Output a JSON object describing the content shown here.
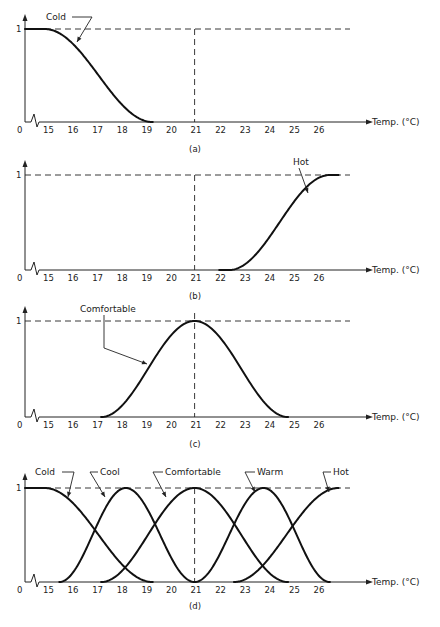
{
  "figure": {
    "x_axis_title": "Temp. (°C)",
    "y_tick_top": "1",
    "x_origin_label": "0",
    "x_tick_labels": [
      "15",
      "16",
      "17",
      "18",
      "19",
      "20",
      "21",
      "22",
      "23",
      "24",
      "25",
      "26"
    ]
  },
  "chart_data": [
    {
      "panel": "(a)",
      "type": "line",
      "title": "",
      "xlabel": "Temp. (°C)",
      "ylabel": "",
      "xlim": [
        15,
        27
      ],
      "ylim": [
        0,
        1
      ],
      "x_ticks": [
        15,
        16,
        17,
        18,
        19,
        20,
        21,
        22,
        23,
        24,
        25,
        26
      ],
      "y_ticks": [
        1
      ],
      "reference_lines": [
        {
          "type": "horizontal",
          "y": 1,
          "style": "dashed"
        },
        {
          "type": "vertical",
          "x": 21,
          "style": "dashed"
        }
      ],
      "series": [
        {
          "name": "Cold",
          "shape": "z-shaped",
          "x": [
            14.3,
            15,
            16,
            17,
            17.7,
            18,
            19,
            19.3
          ],
          "values": [
            1,
            0.98,
            0.85,
            0.6,
            0.42,
            0.32,
            0.05,
            0
          ]
        }
      ]
    },
    {
      "panel": "(b)",
      "type": "line",
      "title": "",
      "xlabel": "Temp. (°C)",
      "ylabel": "",
      "xlim": [
        15,
        27
      ],
      "ylim": [
        0,
        1
      ],
      "x_ticks": [
        15,
        16,
        17,
        18,
        19,
        20,
        21,
        22,
        23,
        24,
        25,
        26
      ],
      "y_ticks": [
        1
      ],
      "reference_lines": [
        {
          "type": "horizontal",
          "y": 1,
          "style": "dashed"
        },
        {
          "type": "vertical",
          "x": 21,
          "style": "dashed"
        }
      ],
      "series": [
        {
          "name": "Hot",
          "shape": "s-shaped",
          "x": [
            22,
            22.5,
            23,
            24,
            24.7,
            25,
            26,
            26.5,
            26.9
          ],
          "values": [
            0,
            0,
            0.05,
            0.4,
            0.6,
            0.7,
            0.95,
            1,
            1
          ]
        }
      ]
    },
    {
      "panel": "(c)",
      "type": "line",
      "title": "",
      "xlabel": "Temp. (°C)",
      "ylabel": "",
      "xlim": [
        15,
        27
      ],
      "ylim": [
        0,
        1
      ],
      "x_ticks": [
        15,
        16,
        17,
        18,
        19,
        20,
        21,
        22,
        23,
        24,
        25,
        26
      ],
      "y_ticks": [
        1
      ],
      "reference_lines": [
        {
          "type": "horizontal",
          "y": 1,
          "style": "dashed"
        },
        {
          "type": "vertical",
          "x": 21,
          "style": "dashed"
        }
      ],
      "series": [
        {
          "name": "Comfortable",
          "shape": "bell",
          "x": [
            17.2,
            18,
            19,
            20,
            21,
            22,
            23,
            24,
            24.8
          ],
          "values": [
            0,
            0.1,
            0.55,
            0.9,
            1,
            0.9,
            0.55,
            0.1,
            0
          ]
        }
      ]
    },
    {
      "panel": "(d)",
      "type": "line",
      "title": "",
      "xlabel": "Temp. (°C)",
      "ylabel": "",
      "xlim": [
        15,
        27
      ],
      "ylim": [
        0,
        1
      ],
      "x_ticks": [
        15,
        16,
        17,
        18,
        19,
        20,
        21,
        22,
        23,
        24,
        25,
        26
      ],
      "y_ticks": [
        1
      ],
      "reference_lines": [
        {
          "type": "horizontal",
          "y": 1,
          "style": "dashed"
        },
        {
          "type": "vertical",
          "x": 21,
          "style": "dashed"
        }
      ],
      "series": [
        {
          "name": "Cold",
          "shape": "z-shaped",
          "center": 14.3,
          "support": [
            14.3,
            19.3
          ],
          "x": [
            14.3,
            16.8,
            19.3
          ],
          "values": [
            1,
            0.5,
            0
          ]
        },
        {
          "name": "Cool",
          "shape": "bell",
          "center": 18.2,
          "support": [
            15.5,
            21
          ],
          "x": [
            15.5,
            18.2,
            21
          ],
          "values": [
            0,
            1,
            0
          ]
        },
        {
          "name": "Comfortable",
          "shape": "bell",
          "center": 21,
          "support": [
            17.2,
            24.8
          ],
          "x": [
            17.2,
            21,
            24.8
          ],
          "values": [
            0,
            1,
            0
          ]
        },
        {
          "name": "Warm",
          "shape": "bell",
          "center": 23.8,
          "support": [
            21,
            26.5
          ],
          "x": [
            21,
            23.8,
            26.5
          ],
          "values": [
            0,
            1,
            0
          ]
        },
        {
          "name": "Hot",
          "shape": "s-shaped",
          "center": 26.9,
          "support": [
            22.5,
            26.9
          ],
          "x": [
            22.5,
            24.7,
            26.9
          ],
          "values": [
            0,
            0.5,
            1
          ]
        }
      ]
    }
  ]
}
